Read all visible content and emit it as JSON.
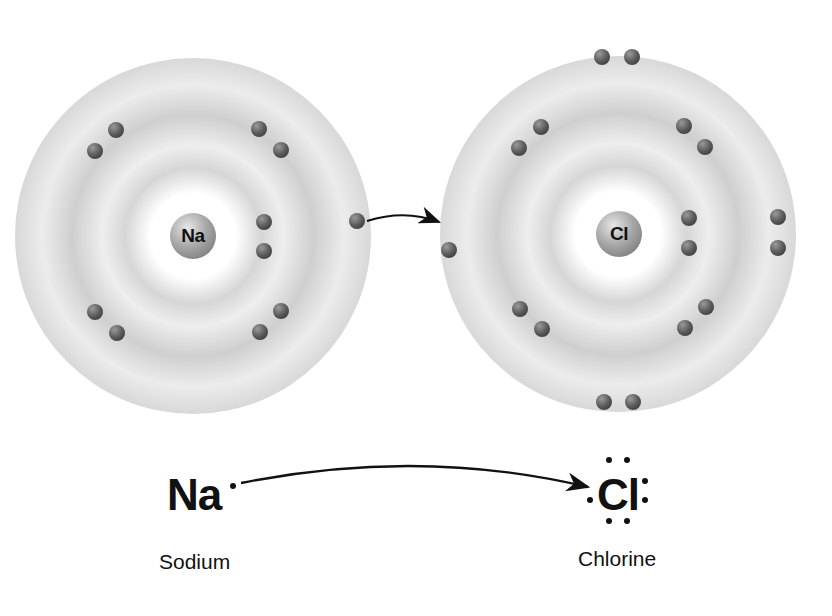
{
  "sodium_atom": {
    "nucleus_label": "Na",
    "center": [
      193,
      236
    ],
    "shell_electron_counts": [
      2,
      8,
      1
    ]
  },
  "chlorine_atom": {
    "nucleus_label": "Cl",
    "center": [
      617,
      234
    ],
    "shell_electron_counts": [
      2,
      8,
      7
    ],
    "gained_electrons": 1
  },
  "transfer_arrow": {
    "from": "Na outer electron",
    "to": "Cl outer shell"
  },
  "lewis": {
    "sodium_symbol": "Na",
    "chlorine_symbol": "Cl",
    "sodium_label": "Sodium",
    "chlorine_label": "Chlorine"
  },
  "colors": {
    "electron": "#4a4a4a",
    "shell": "#d0d0d0",
    "text": "#111111"
  }
}
